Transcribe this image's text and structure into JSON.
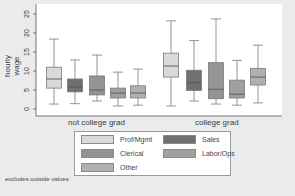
{
  "chart_data": {
    "type": "boxplot",
    "title": "",
    "ylabel": "hourly wage",
    "xlabel": "",
    "ylim": [
      0,
      27
    ],
    "yticks": [
      0,
      5,
      10,
      15,
      20,
      25
    ],
    "ytick_labels": [
      "0",
      "5",
      "10",
      "15",
      "20",
      "25"
    ],
    "grid": false,
    "categories": [
      "not college grad",
      "college grad"
    ],
    "series": [
      {
        "name": "Prof/Mgmt",
        "color": "#d9d9d9",
        "values": [
          {
            "whisker_low": 1.3,
            "q1": 5.5,
            "median": 7.9,
            "q3": 11.0,
            "whisker_high": 18.4
          },
          {
            "whisker_low": 0.8,
            "q1": 8.4,
            "median": 11.3,
            "q3": 14.7,
            "whisker_high": 23.2
          }
        ]
      },
      {
        "name": "Sales",
        "color": "#707070",
        "values": [
          {
            "whisker_low": 1.4,
            "q1": 4.5,
            "median": 5.8,
            "q3": 7.9,
            "whisker_high": 12.9
          },
          {
            "whisker_low": 2.1,
            "q1": 4.9,
            "median": 6.9,
            "q3": 10.2,
            "whisker_high": 18.0
          }
        ]
      },
      {
        "name": "Clerical",
        "color": "#949494",
        "values": [
          {
            "whisker_low": 2.1,
            "q1": 3.7,
            "median": 5.0,
            "q3": 8.7,
            "whisker_high": 14.2
          },
          {
            "whisker_low": 1.3,
            "q1": 2.7,
            "median": 5.2,
            "q3": 12.2,
            "whisker_high": 23.7
          }
        ]
      },
      {
        "name": "Labor/Ops",
        "color": "#a0a0a0",
        "values": [
          {
            "whisker_low": 0.8,
            "q1": 2.9,
            "median": 4.2,
            "q3": 5.5,
            "whisker_high": 9.7
          },
          {
            "whisker_low": 1.0,
            "q1": 2.9,
            "median": 3.9,
            "q3": 7.6,
            "whisker_high": 12.8
          }
        ]
      },
      {
        "name": "Other",
        "color": "#b0b0b0",
        "values": [
          {
            "whisker_low": 1.0,
            "q1": 2.9,
            "median": 4.2,
            "q3": 6.1,
            "whisker_high": 10.5
          },
          {
            "whisker_low": 1.6,
            "q1": 6.3,
            "median": 8.4,
            "q3": 10.7,
            "whisker_high": 16.8
          }
        ]
      }
    ],
    "legend": {
      "position": "bottom",
      "entries": [
        "Prof/Mgmt",
        "Sales",
        "Clerical",
        "Labor/Ops",
        "Other"
      ]
    },
    "note": "excludes outside values"
  }
}
